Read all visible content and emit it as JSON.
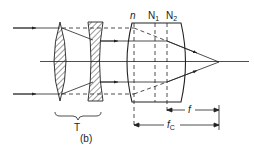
{
  "figure": {
    "caption": "(b)",
    "labels": {
      "n": "n",
      "N1": "N",
      "N1_sub": "1",
      "N2": "N",
      "N2_sub": "2",
      "T": "T",
      "f": "f",
      "fc": "f",
      "fc_sub": "C"
    },
    "colors": {
      "line": "#222222",
      "background": "#ffffff"
    }
  }
}
